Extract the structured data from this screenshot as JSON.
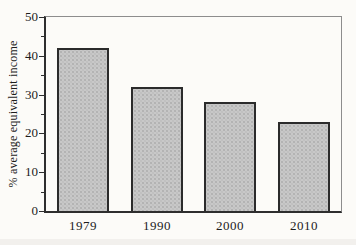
{
  "figure": {
    "background": "#fcfbf8",
    "text_color": "#1c1c1c"
  },
  "chart_data": {
    "type": "bar",
    "categories": [
      "1979",
      "1990",
      "2000",
      "2010"
    ],
    "values": [
      42,
      32,
      28,
      23
    ],
    "title": "",
    "xlabel": "",
    "ylabel": "% average equivalent income",
    "ylim": [
      0,
      50
    ],
    "yticks_major": [
      0,
      10,
      20,
      30,
      40,
      50
    ],
    "yticks_minor": [
      5,
      15,
      25,
      35,
      45
    ],
    "grid": false,
    "legend": "none",
    "colors": {
      "bar_fill": "#c8c8c8",
      "bar_stipple": "#a9a9a9",
      "bar_border": "#2b2b2b",
      "axis": "#2e2e2e",
      "frame": "#8d8d8d",
      "background": "#fcfbf8",
      "text": "#1c1c1c"
    }
  }
}
